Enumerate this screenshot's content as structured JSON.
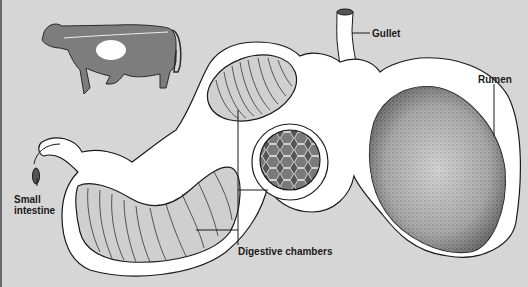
{
  "diagram": {
    "colors": {
      "background": "#d6d6d6",
      "organ_wall": "#ffffff",
      "outline": "#1a1a1a",
      "stipple": "#555555"
    },
    "labels": {
      "gullet": "Gullet",
      "rumen": "Rumen",
      "small_intestine_line1": "Small",
      "small_intestine_line2": "intestine",
      "digestive_chambers": "Digestive chambers"
    },
    "parts": [
      {
        "name": "cow-silhouette",
        "description": "cow with stomach region highlighted"
      },
      {
        "name": "gullet",
        "description": "tube entering from top"
      },
      {
        "name": "rumen",
        "description": "large stippled chamber on the right"
      },
      {
        "name": "reticulum",
        "description": "honeycomb-patterned chamber"
      },
      {
        "name": "omasum",
        "description": "folded chamber upper-left"
      },
      {
        "name": "abomasum",
        "description": "ridged curved chamber lower-left"
      },
      {
        "name": "small-intestine",
        "description": "tube exiting left"
      }
    ]
  }
}
